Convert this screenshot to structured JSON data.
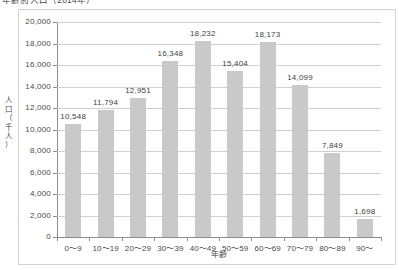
{
  "chart_title": "年齢別人口（2014年）",
  "axes": {
    "y_title_chars": [
      "人",
      "口",
      "（",
      "千",
      "人",
      "）"
    ],
    "y_title": "人口（千人）",
    "x_title": "年齢",
    "y_ticks": [
      "0",
      "2,000",
      "4,000",
      "6,000",
      "8,000",
      "10,000",
      "12,000",
      "14,000",
      "16,000",
      "18,000",
      "20,000"
    ]
  },
  "chart_data": {
    "type": "bar",
    "title": "年齢別人口（2014年）",
    "xlabel": "年齢",
    "ylabel": "人口（千人）",
    "ylim": [
      0,
      20000
    ],
    "ytick_step": 2000,
    "grid": true,
    "legend": "none",
    "bar_color": "#c9c9c9",
    "categories": [
      "0〜9",
      "10〜19",
      "20〜29",
      "30〜39",
      "40〜49",
      "50〜59",
      "60〜69",
      "70〜79",
      "80〜89",
      "90〜"
    ],
    "values": [
      10548,
      11794,
      12951,
      16348,
      18232,
      15404,
      18173,
      14099,
      7849,
      1698
    ],
    "data_labels": [
      "10,548",
      "11,794",
      "12,951",
      "16,348",
      "18,232",
      "15,404",
      "18,173",
      "14,099",
      "7,849",
      "1,698"
    ]
  }
}
